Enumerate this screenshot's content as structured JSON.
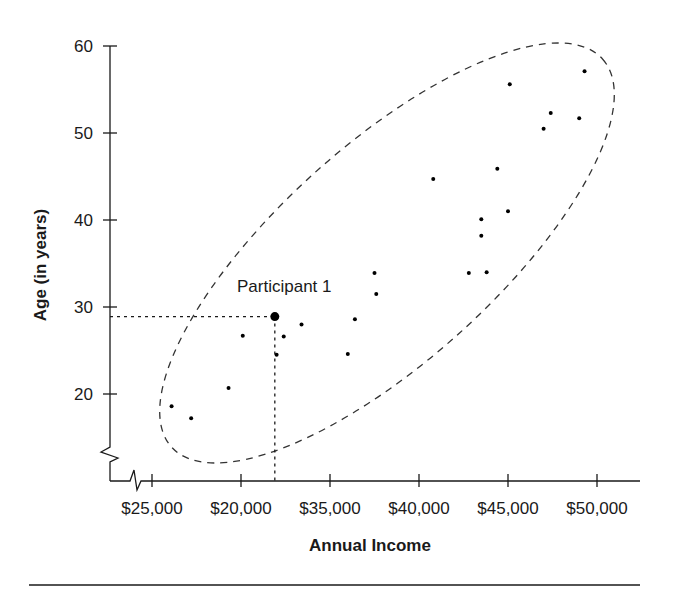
{
  "chart_data": {
    "type": "scatter",
    "title": "",
    "xlabel": "Annual Income",
    "ylabel": "Age (in years)",
    "x_tick_labels": [
      "$25,000",
      "$20,000",
      "$35,000",
      "$40,000",
      "$45,000",
      "$50,000"
    ],
    "x_tick_values_implied": [
      25000,
      30000,
      35000,
      40000,
      45000,
      50000
    ],
    "y_tick_labels": [
      "20",
      "30",
      "40",
      "50",
      "60"
    ],
    "y_tick_values": [
      20,
      30,
      40,
      50,
      60
    ],
    "xlim": [
      20800,
      50800
    ],
    "ylim": [
      10.9,
      60
    ],
    "axis_breaks": {
      "x": true,
      "y": true
    },
    "grid": false,
    "legend": null,
    "annotations": [
      {
        "text": "Participant 1",
        "x": 31900,
        "y": 28.9,
        "guide_lines": "dotted lines to both axes"
      },
      {
        "text": "",
        "shape": "dashed ellipse enclosing all points"
      }
    ],
    "series": [
      {
        "name": "Participants",
        "points": [
          {
            "x": 49300,
            "y": 57.1
          },
          {
            "x": 45100,
            "y": 55.6
          },
          {
            "x": 47400,
            "y": 52.3
          },
          {
            "x": 49000,
            "y": 51.7
          },
          {
            "x": 47000,
            "y": 50.5
          },
          {
            "x": 44400,
            "y": 45.9
          },
          {
            "x": 40800,
            "y": 44.7
          },
          {
            "x": 45000,
            "y": 41.0
          },
          {
            "x": 43500,
            "y": 40.1
          },
          {
            "x": 43500,
            "y": 38.2
          },
          {
            "x": 42800,
            "y": 33.9
          },
          {
            "x": 43800,
            "y": 34.0
          },
          {
            "x": 37500,
            "y": 33.9
          },
          {
            "x": 37600,
            "y": 31.5
          },
          {
            "x": 31900,
            "y": 28.9,
            "label": "Participant 1",
            "highlight": true
          },
          {
            "x": 36400,
            "y": 28.6
          },
          {
            "x": 33400,
            "y": 28.0
          },
          {
            "x": 30100,
            "y": 26.7
          },
          {
            "x": 32400,
            "y": 26.6
          },
          {
            "x": 32000,
            "y": 24.5
          },
          {
            "x": 36000,
            "y": 24.6
          },
          {
            "x": 29300,
            "y": 20.7
          },
          {
            "x": 26100,
            "y": 18.6
          },
          {
            "x": 27200,
            "y": 17.2
          }
        ]
      }
    ]
  },
  "layout": {
    "plot": {
      "x0_px": 152,
      "x_step_px": 89,
      "x0_val": 25000,
      "x_step_val": 5000,
      "y60_px": 46,
      "px_per_year": 8.7
    },
    "colors": {
      "ink": "#1a1a1a",
      "background": "#ffffff",
      "dashed": "#333333"
    }
  }
}
